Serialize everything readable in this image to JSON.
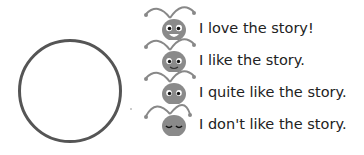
{
  "rating_circle": {
    "label": ""
  },
  "ratings": [
    {
      "text": "I love the story!",
      "face": "big-smile"
    },
    {
      "text": "I like the story.",
      "face": "smile"
    },
    {
      "text": "I quite like the story.",
      "face": "neutral"
    },
    {
      "text": "I don't like the story.",
      "face": "sad"
    }
  ],
  "colors": {
    "ant_head": "#8a8a8a",
    "outline": "#555555"
  }
}
